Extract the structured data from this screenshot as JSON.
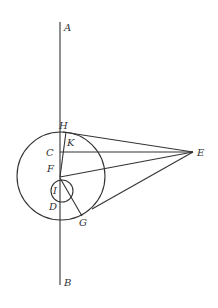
{
  "diagram": {
    "labels": {
      "A": "A",
      "B": "B",
      "H": "H",
      "K": "K",
      "C": "C",
      "E": "E",
      "F": "F",
      "I": "I",
      "D": "D",
      "G": "G"
    },
    "colors": {
      "stroke": "#333333",
      "background": "#ffffff"
    }
  }
}
